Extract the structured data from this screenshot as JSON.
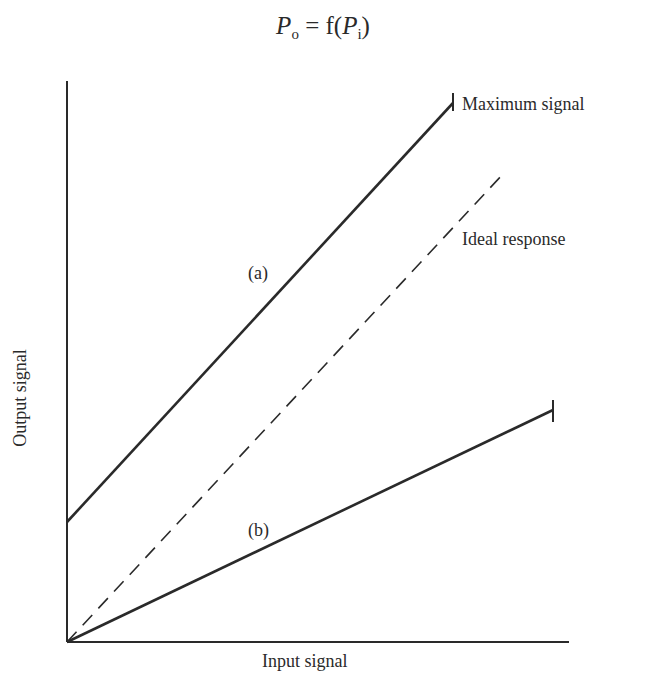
{
  "chart_data": {
    "type": "line",
    "title": "Po = f(Pi)",
    "title_parts": {
      "lhs_var": "P",
      "lhs_sub": "o",
      "eq": " = f(",
      "rhs_var": "P",
      "rhs_sub": "i",
      "close": ")"
    },
    "xlabel": "Input signal",
    "ylabel": "Output signal",
    "xlim": [
      0,
      100
    ],
    "ylim": [
      0,
      100
    ],
    "grid": false,
    "ticks": false,
    "series": [
      {
        "name": "(a)",
        "style": "solid",
        "x": [
          0,
          76.9
        ],
        "y": [
          21.4,
          96.1
        ],
        "end_marker": "tick",
        "px": [
          [
            67,
            522
          ],
          [
            453,
            103
          ]
        ]
      },
      {
        "name": "Ideal response",
        "style": "dashed",
        "x": [
          0,
          86.9
        ],
        "y": [
          0,
          83.4
        ],
        "px": [
          [
            67,
            642
          ],
          [
            503,
            174
          ]
        ]
      },
      {
        "name": "(b)",
        "style": "solid",
        "x": [
          0,
          96.8
        ],
        "y": [
          0,
          41.4
        ],
        "end_marker": "tick",
        "px": [
          [
            67,
            642
          ],
          [
            553,
            410
          ]
        ]
      }
    ],
    "annotations": [
      {
        "text": "Maximum signal",
        "attached_to": "(a) end tick"
      },
      {
        "text": "Ideal response",
        "attached_to": "dashed line"
      },
      {
        "text": "(a)",
        "attached_to": "upper solid line"
      },
      {
        "text": "(b)",
        "attached_to": "lower solid line"
      }
    ]
  },
  "labels": {
    "max_signal": "Maximum signal",
    "ideal": "Ideal response",
    "a": "(a)",
    "b": "(b)",
    "x": "Input signal",
    "y": "Output signal"
  },
  "colors": {
    "ink": "#2a2a2a",
    "background": "#ffffff"
  }
}
